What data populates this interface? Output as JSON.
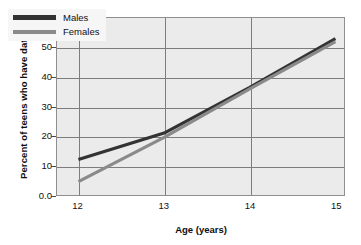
{
  "chart_data": {
    "type": "line",
    "title": "",
    "xlabel": "Age (years)",
    "ylabel": "Percent of teens who have dated",
    "x": [
      12,
      13,
      14,
      15
    ],
    "xlim": [
      11.75,
      15.1
    ],
    "ylim": [
      0,
      60
    ],
    "xticks": [
      "12",
      "13",
      "14",
      "15"
    ],
    "yticks": [
      "0.0",
      "10",
      "20",
      "30",
      "40",
      "50",
      "60"
    ],
    "ytick_values": [
      0,
      10,
      20,
      30,
      40,
      50,
      60
    ],
    "grid": "both",
    "legend_position": "upper-left-inside",
    "series": [
      {
        "name": "Males",
        "color": "#333333",
        "values": [
          12,
          21,
          36.5,
          53
        ]
      },
      {
        "name": "Females",
        "color": "#8a8a8a",
        "values": [
          4.5,
          19.5,
          36,
          52
        ]
      }
    ]
  },
  "legend": {
    "items": [
      {
        "label": "Males",
        "color": "#333333"
      },
      {
        "label": "Females",
        "color": "#8a8a8a"
      }
    ]
  },
  "axes": {
    "y_title": "Percent of teens who have dated",
    "x_title": "Age (years)"
  },
  "colors": {
    "plot_background": "#ebebeb",
    "grid": "#7d7d7d",
    "frame": "#8e8e8e",
    "males": "#333333",
    "females": "#8a8a8a",
    "text": "#111111"
  }
}
